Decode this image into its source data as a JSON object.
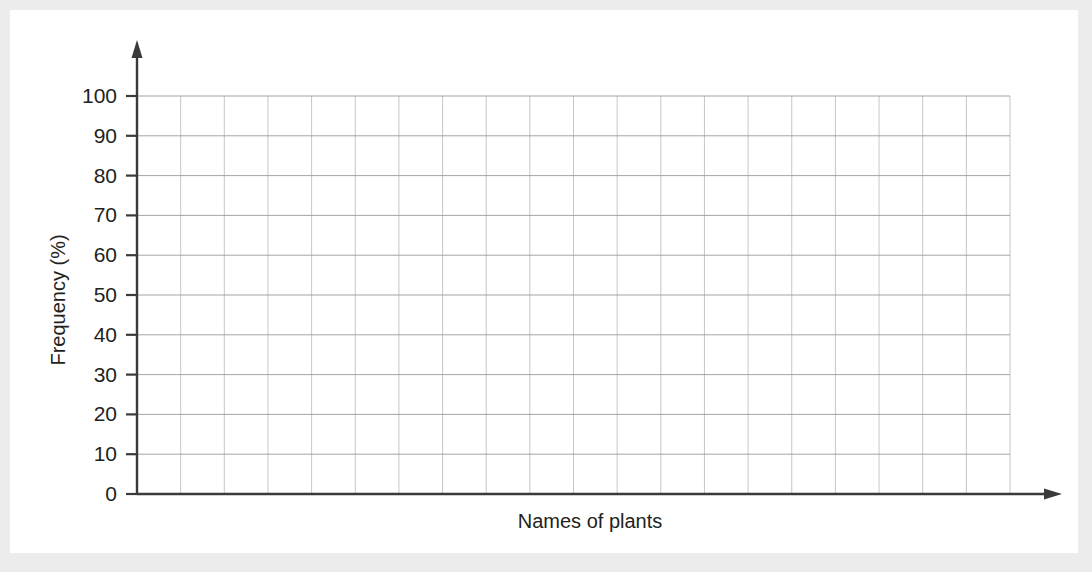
{
  "figure": {
    "background_color": "#ececec",
    "card_color": "#ffffff",
    "axis_color": "#3a3a3a",
    "grid_color": "#9a9a9a"
  },
  "chart_data": {
    "type": "bar",
    "title": "",
    "subtitle": "",
    "xlabel": "Names of plants",
    "ylabel": "Frequency (%)",
    "categories": [],
    "values": [],
    "series": [],
    "ylim": [
      0,
      100
    ],
    "ytick_labels": [
      "0",
      "10",
      "20",
      "30",
      "40",
      "50",
      "60",
      "70",
      "80",
      "90",
      "100"
    ],
    "ytick_values": [
      0,
      10,
      20,
      30,
      40,
      50,
      60,
      70,
      80,
      90,
      100
    ],
    "xtick_labels": [],
    "xtick_values": [],
    "grid": true,
    "grid_rows": 10,
    "grid_columns": 20,
    "legend": [],
    "legend_position": "none",
    "annotations": [],
    "note": "Empty blank grid template for plotting a bar chart; no data plotted."
  },
  "axes": {
    "y_label": "Frequency (%)",
    "x_label": "Names of plants",
    "y_ticks": [
      "100",
      "90",
      "80",
      "70",
      "60",
      "50",
      "40",
      "30",
      "20",
      "10",
      "0"
    ]
  }
}
